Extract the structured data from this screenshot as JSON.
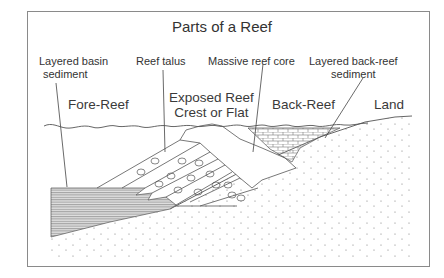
{
  "title": "Parts of a Reef",
  "labels": {
    "basin_sediment_line1": "Layered basin",
    "basin_sediment_line2": "sediment",
    "reef_talus": "Reef talus",
    "reef_core": "Massive reef core",
    "backreef_sediment_line1": "Layered back-reef",
    "backreef_sediment_line2": "sediment"
  },
  "regions": {
    "fore_reef": "Fore-Reef",
    "crest_line1": "Exposed Reef",
    "crest_line2": "Crest or Flat",
    "back_reef": "Back-Reef",
    "land": "Land"
  },
  "colors": {
    "line": "#555555",
    "frame": "#8a8a8a",
    "text": "#333333",
    "basin_fill": "#cfcfcf"
  }
}
